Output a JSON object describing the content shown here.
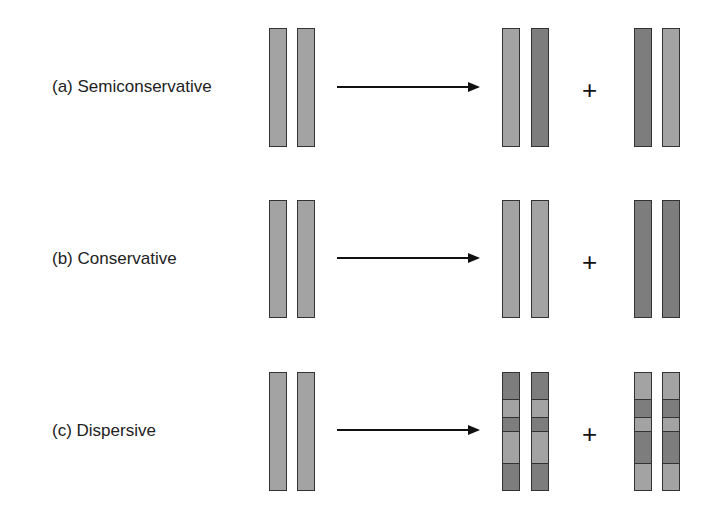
{
  "figure": {
    "rows": [
      {
        "id": "a",
        "label": "(a) Semiconservative",
        "top": 28,
        "height": 117,
        "parent": [
          "light",
          "light"
        ],
        "product1": [
          "light",
          "dark"
        ],
        "product2": [
          "dark",
          "light"
        ]
      },
      {
        "id": "b",
        "label": "(b) Conservative",
        "top": 200,
        "height": 116,
        "parent": [
          "light",
          "light"
        ],
        "product1": [
          "light",
          "light"
        ],
        "product2": [
          "dark",
          "dark"
        ]
      },
      {
        "id": "c",
        "label": "(c) Dispersive",
        "top": 372,
        "height": 117,
        "parent": [
          "light",
          "light"
        ],
        "product1_segments": [
          "dark",
          "light",
          "dark",
          "light",
          "dark"
        ],
        "product2_segments": [
          "light",
          "dark",
          "light",
          "dark",
          "light"
        ]
      }
    ],
    "plus_sign": "+",
    "colors": {
      "light": "#a3a3a3",
      "dark": "#7d7d7d",
      "outline": "#333333"
    }
  }
}
